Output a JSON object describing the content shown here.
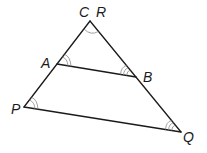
{
  "diagram": {
    "type": "similar-triangles",
    "vertices": {
      "apex": {
        "labels": [
          "C",
          "R"
        ],
        "x": 90,
        "y": 21
      },
      "A": {
        "label": "A",
        "x": 57,
        "y": 64
      },
      "B": {
        "label": "B",
        "x": 136,
        "y": 77
      },
      "P": {
        "label": "P",
        "x": 24,
        "y": 107
      },
      "Q": {
        "label": "Q",
        "x": 181,
        "y": 132
      }
    },
    "segments": [
      "C-A",
      "C-B",
      "A-B",
      "R-P",
      "R-Q",
      "P-Q"
    ],
    "angle_marks": {
      "C_R": 1,
      "A": 2,
      "P": 2,
      "B": 3,
      "Q": 3
    },
    "labels": {
      "C": "C",
      "R": "R",
      "A": "A",
      "B": "B",
      "P": "P",
      "Q": "Q"
    },
    "colors": {
      "line": "#1a1a1a",
      "arc": "#8a8a8a",
      "background": "#ffffff"
    }
  }
}
